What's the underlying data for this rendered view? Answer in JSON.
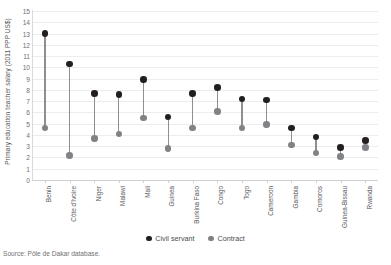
{
  "chart_data": {
    "type": "scatter",
    "title": "",
    "xlabel": "",
    "ylabel": "Primary education teacher salary (2011 PPP US$)",
    "ylim": [
      0,
      15
    ],
    "ytick_step": 1,
    "yticks": [
      "15",
      "14",
      "13",
      "12",
      "11",
      "10",
      "9",
      "8",
      "7",
      "6",
      "5",
      "4",
      "3",
      "2",
      "1",
      "0"
    ],
    "grid": true,
    "legend_position": "bottom-center",
    "categories": [
      "Benin",
      "Côte d'Ivoire",
      "Niger",
      "Malawi",
      "Mali",
      "Guinea",
      "Burkina Faso",
      "Congo",
      "Togo",
      "Cameroon",
      "Gambia",
      "Comoros",
      "Guinea-Bissau",
      "Rwanda"
    ],
    "series": [
      {
        "name": "Civil servant",
        "color": "#231f20",
        "values": [
          13.0,
          10.3,
          7.7,
          7.6,
          8.9,
          5.6,
          7.7,
          8.2,
          7.2,
          7.1,
          4.6,
          3.8,
          2.9,
          3.5
        ]
      },
      {
        "name": "Contract",
        "color": "#808285",
        "values": [
          4.6,
          2.2,
          3.7,
          4.1,
          5.5,
          2.8,
          4.6,
          6.1,
          4.6,
          4.9,
          3.1,
          2.4,
          2.1,
          2.9
        ]
      }
    ],
    "stem_color": "#8e8f91",
    "gridline_color": "#eceded",
    "source": "Source: Pôle de Dakar database."
  },
  "legend": {
    "items": [
      {
        "label": "Civil servant",
        "color": "#231f20"
      },
      {
        "label": "Contract",
        "color": "#808285"
      }
    ]
  },
  "footer": {
    "source": "Source: Pôle de Dakar database."
  }
}
